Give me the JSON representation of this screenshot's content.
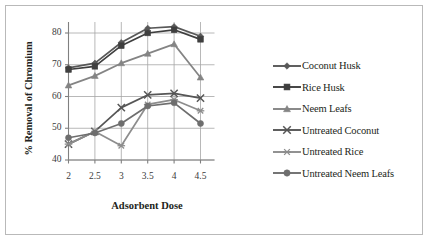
{
  "chart_data": {
    "type": "line",
    "title": "",
    "xlabel": "Adsorbent Dose",
    "ylabel": "% Removal of Chromium",
    "x": [
      2,
      2.5,
      3,
      3.5,
      4,
      4.5
    ],
    "categories": [
      "2",
      "2.5",
      "3",
      "3.5",
      "4",
      "4.5"
    ],
    "xlim": [
      2,
      4.5
    ],
    "ylim": [
      40,
      80
    ],
    "yticks": [
      40,
      50,
      60,
      70,
      80
    ],
    "ytick_labels": [
      "40",
      "50",
      "60",
      "70",
      "80"
    ],
    "grid": "horizontal-and-vertical",
    "legend_position": "right",
    "series": [
      {
        "name": "Coconut Husk",
        "marker": "diamond",
        "color": "#585858",
        "values": [
          69,
          70.5,
          77,
          81.5,
          82,
          79
        ]
      },
      {
        "name": "Rice Husk",
        "marker": "square",
        "color": "#3f3f3f",
        "values": [
          68.5,
          69.5,
          76,
          80,
          81,
          78
        ]
      },
      {
        "name": "Neem Leafs",
        "marker": "triangle",
        "color": "#848484",
        "values": [
          63.5,
          66.5,
          70.5,
          73.5,
          76.5,
          66
        ]
      },
      {
        "name": "Untreated Coconut",
        "marker": "x",
        "color": "#565656",
        "values": [
          45,
          49,
          56.5,
          60.5,
          61,
          59.5
        ]
      },
      {
        "name": "Untreated Rice",
        "marker": "asterisk",
        "color": "#8d8d8d",
        "values": [
          45,
          49,
          44.5,
          57.5,
          59,
          55.5
        ]
      },
      {
        "name": "Untreated Neem Leafs",
        "marker": "circle",
        "color": "#6e6e6e",
        "values": [
          47,
          48.5,
          51.5,
          57,
          58,
          51.5
        ]
      }
    ]
  },
  "axes": {
    "y_title": "% Removal of Chromium",
    "x_title": "Adsorbent Dose",
    "y_tick_labels": [
      "80",
      "70",
      "60",
      "50",
      "40"
    ],
    "x_tick_labels": [
      "2",
      "2.5",
      "3",
      "3.5",
      "4",
      "4.5"
    ]
  },
  "legend": {
    "items": [
      {
        "label": "Coconut Husk"
      },
      {
        "label": "Rice Husk"
      },
      {
        "label": "Neem Leafs"
      },
      {
        "label": "Untreated Coconut"
      },
      {
        "label": "Untreated Rice"
      },
      {
        "label": "Untreated Neem Leafs"
      }
    ]
  },
  "style": {
    "frame_color": "#b9b9b9",
    "grid_color": "#a6a6a6",
    "axis_color": "#808080",
    "background": "#ffffff",
    "text_color": "#231f20"
  }
}
